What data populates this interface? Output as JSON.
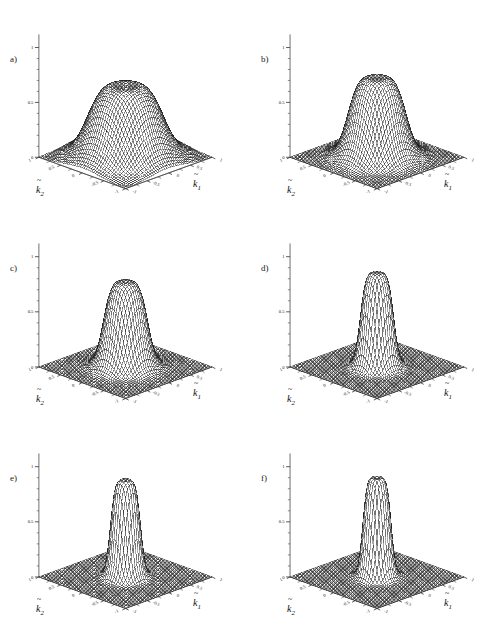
{
  "figure": {
    "background": "#ffffff",
    "ghost_text": "",
    "mesh_color": "#1a1a1a",
    "fill_color": "#ffffff",
    "columns": 2,
    "rows": 3
  },
  "axes": {
    "x_label": "k",
    "x_sub": "1",
    "y_label": "k",
    "y_sub": "2",
    "z_label": "",
    "x_ticks": [
      "-1",
      "-0.5",
      "0",
      "0.5",
      "1"
    ],
    "y_ticks": [
      "-1",
      "-0.5",
      "0",
      "0.5",
      "1"
    ],
    "z_ticks": [
      "0",
      "0.5",
      "1"
    ],
    "z_min": 0,
    "z_max": 1,
    "x_min": -1,
    "x_max": 1,
    "y_min": -1,
    "y_max": 1
  },
  "panels": [
    {
      "letter": "a)",
      "shape": "broad plateau with shallow central dip",
      "plateau_radius": 0.62,
      "edge_softness": 0.46,
      "height": 0.74,
      "dip_depth": 0.085,
      "dip_radius": 0.3
    },
    {
      "letter": "b)",
      "shape": "narrower rounded plateau with central dip",
      "plateau_radius": 0.47,
      "edge_softness": 0.3,
      "height": 0.8,
      "dip_depth": 0.075,
      "dip_radius": 0.24
    },
    {
      "letter": "c)",
      "shape": "narrow plateau, steeper flanks, small crater",
      "plateau_radius": 0.36,
      "edge_softness": 0.21,
      "height": 0.84,
      "dip_depth": 0.065,
      "dip_radius": 0.19
    },
    {
      "letter": "d)",
      "shape": "tall narrow column with crater rim",
      "plateau_radius": 0.27,
      "edge_softness": 0.13,
      "height": 0.93,
      "dip_depth": 0.075,
      "dip_radius": 0.16
    },
    {
      "letter": "e)",
      "shape": "tall narrow column, sharp crater rim",
      "plateau_radius": 0.245,
      "edge_softness": 0.105,
      "height": 0.96,
      "dip_depth": 0.085,
      "dip_radius": 0.15
    },
    {
      "letter": "f)",
      "shape": "tallest narrow column, deep crater",
      "plateau_radius": 0.23,
      "edge_softness": 0.09,
      "height": 0.99,
      "dip_depth": 0.095,
      "dip_radius": 0.145
    }
  ],
  "chart_data": {
    "type": "surface",
    "title": "",
    "xlabel": "k~1",
    "ylabel": "k~2",
    "zlabel": "",
    "xlim": [
      -1,
      1
    ],
    "ylim": [
      -1,
      1
    ],
    "zlim": [
      0,
      1
    ],
    "grid": false,
    "legend": "none",
    "projection": "3d-wireframe-mesh",
    "panel_count": 6,
    "panel_labels": [
      "a)",
      "b)",
      "c)",
      "d)",
      "e)",
      "f)"
    ],
    "series": [
      {
        "name": "a)",
        "peak_height": 0.74,
        "plateau_radius": 0.62,
        "edge_width": 0.46,
        "central_dip": 0.085,
        "radial_profile_r": [
          0.0,
          0.1,
          0.2,
          0.3,
          0.4,
          0.5,
          0.6,
          0.7,
          0.8,
          0.9,
          1.0,
          1.2,
          1.4
        ],
        "radial_profile_z": [
          0.66,
          0.67,
          0.7,
          0.73,
          0.74,
          0.73,
          0.68,
          0.57,
          0.41,
          0.25,
          0.13,
          0.03,
          0.0
        ]
      },
      {
        "name": "b)",
        "peak_height": 0.8,
        "plateau_radius": 0.47,
        "edge_width": 0.3,
        "central_dip": 0.075,
        "radial_profile_r": [
          0.0,
          0.1,
          0.2,
          0.3,
          0.4,
          0.5,
          0.6,
          0.7,
          0.8,
          0.9,
          1.0,
          1.2,
          1.4
        ],
        "radial_profile_z": [
          0.73,
          0.75,
          0.78,
          0.8,
          0.79,
          0.73,
          0.6,
          0.43,
          0.27,
          0.15,
          0.07,
          0.01,
          0.0
        ]
      },
      {
        "name": "c)",
        "peak_height": 0.84,
        "plateau_radius": 0.36,
        "edge_width": 0.21,
        "central_dip": 0.065,
        "radial_profile_r": [
          0.0,
          0.1,
          0.2,
          0.3,
          0.4,
          0.5,
          0.6,
          0.7,
          0.8,
          0.9,
          1.0,
          1.2,
          1.4
        ],
        "radial_profile_z": [
          0.78,
          0.81,
          0.84,
          0.83,
          0.75,
          0.58,
          0.38,
          0.22,
          0.11,
          0.05,
          0.02,
          0.0,
          0.0
        ]
      },
      {
        "name": "d)",
        "peak_height": 0.93,
        "plateau_radius": 0.27,
        "edge_width": 0.13,
        "central_dip": 0.075,
        "radial_profile_r": [
          0.0,
          0.1,
          0.2,
          0.3,
          0.4,
          0.5,
          0.6,
          0.7,
          0.8,
          0.9,
          1.0,
          1.2,
          1.4
        ],
        "radial_profile_z": [
          0.86,
          0.91,
          0.93,
          0.86,
          0.64,
          0.38,
          0.19,
          0.08,
          0.03,
          0.01,
          0.0,
          0.0,
          0.0
        ]
      },
      {
        "name": "e)",
        "peak_height": 0.96,
        "plateau_radius": 0.245,
        "edge_width": 0.105,
        "central_dip": 0.085,
        "radial_profile_r": [
          0.0,
          0.1,
          0.2,
          0.3,
          0.4,
          0.5,
          0.6,
          0.7,
          0.8,
          0.9,
          1.0,
          1.2,
          1.4
        ],
        "radial_profile_z": [
          0.88,
          0.94,
          0.96,
          0.84,
          0.57,
          0.3,
          0.13,
          0.05,
          0.02,
          0.0,
          0.0,
          0.0,
          0.0
        ]
      },
      {
        "name": "f)",
        "peak_height": 0.99,
        "plateau_radius": 0.23,
        "edge_width": 0.09,
        "central_dip": 0.095,
        "radial_profile_r": [
          0.0,
          0.1,
          0.2,
          0.3,
          0.4,
          0.5,
          0.6,
          0.7,
          0.8,
          0.9,
          1.0,
          1.2,
          1.4
        ],
        "radial_profile_z": [
          0.9,
          0.97,
          0.99,
          0.83,
          0.52,
          0.25,
          0.1,
          0.04,
          0.01,
          0.0,
          0.0,
          0.0,
          0.0
        ]
      }
    ]
  }
}
